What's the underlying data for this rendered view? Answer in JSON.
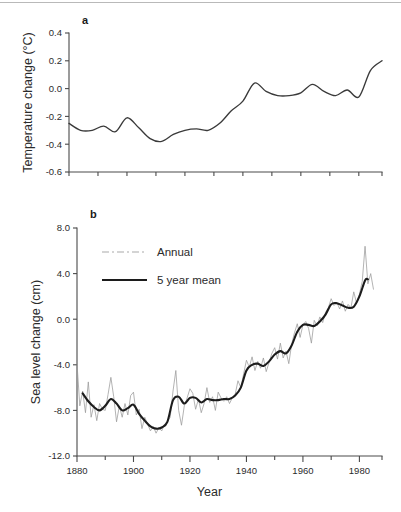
{
  "figure": {
    "panel_a_label": "a",
    "panel_b_label": "b"
  },
  "chart_data": [
    {
      "type": "line",
      "panel": "a",
      "title": "",
      "xlabel": "",
      "ylabel": "Temperature change (°C)",
      "ylim": [
        -0.6,
        0.4
      ],
      "xlim": [
        1880,
        1988
      ],
      "yticks": [
        0.4,
        0.2,
        0.0,
        -0.2,
        -0.4,
        -0.6
      ],
      "ytick_labels": [
        "0.4",
        "0.2",
        "0.0",
        "-0.2",
        "-0.4",
        "-0.6"
      ],
      "xticks": [
        1880,
        1890,
        1900,
        1910,
        1920,
        1930,
        1940,
        1950,
        1960,
        1970,
        1980
      ],
      "xtick_labels": [
        "",
        "",
        "",
        "",
        "",
        "",
        "",
        "",
        "",
        "",
        ""
      ],
      "grid": false,
      "legend": false,
      "series": [
        {
          "name": "Global temperature anomaly (smoothed)",
          "x": [
            1880,
            1884,
            1888,
            1892,
            1896,
            1900,
            1904,
            1908,
            1912,
            1916,
            1920,
            1924,
            1928,
            1932,
            1936,
            1940,
            1944,
            1948,
            1952,
            1956,
            1960,
            1964,
            1968,
            1972,
            1976,
            1980,
            1984,
            1988
          ],
          "values": [
            -0.25,
            -0.3,
            -0.3,
            -0.27,
            -0.31,
            -0.21,
            -0.28,
            -0.36,
            -0.38,
            -0.33,
            -0.3,
            -0.29,
            -0.3,
            -0.25,
            -0.16,
            -0.09,
            0.04,
            -0.02,
            -0.05,
            -0.05,
            -0.03,
            0.03,
            -0.02,
            -0.05,
            -0.01,
            -0.06,
            0.13,
            0.2
          ]
        }
      ]
    },
    {
      "type": "line",
      "panel": "b",
      "title": "",
      "xlabel": "Year",
      "ylabel": "Sea level change (cm)",
      "ylim": [
        -12.0,
        8.0
      ],
      "xlim": [
        1880,
        1988
      ],
      "yticks": [
        8.0,
        4.0,
        0.0,
        -4.0,
        -8.0,
        -12.0
      ],
      "ytick_labels": [
        "8.0",
        "4.0",
        "0.0",
        "-4.0",
        "-8.0",
        "-12.0"
      ],
      "xticks": [
        1880,
        1890,
        1900,
        1910,
        1920,
        1930,
        1940,
        1950,
        1960,
        1970,
        1980
      ],
      "xtick_labels": [
        "1880",
        "",
        "1900",
        "",
        "1920",
        "",
        "1940",
        "",
        "1960",
        "",
        "1980"
      ],
      "grid": false,
      "legend": true,
      "legend_position": "upper-left",
      "legend_entries": [
        "Annual",
        "5 year mean"
      ],
      "series": [
        {
          "name": "Annual",
          "style": "dash-dot-thin",
          "x": [
            1880,
            1881,
            1882,
            1883,
            1884,
            1885,
            1886,
            1887,
            1888,
            1889,
            1890,
            1891,
            1892,
            1893,
            1894,
            1895,
            1896,
            1897,
            1898,
            1899,
            1900,
            1901,
            1902,
            1903,
            1904,
            1905,
            1906,
            1907,
            1908,
            1909,
            1910,
            1911,
            1912,
            1913,
            1914,
            1915,
            1916,
            1917,
            1918,
            1919,
            1920,
            1921,
            1922,
            1923,
            1924,
            1925,
            1926,
            1927,
            1928,
            1929,
            1930,
            1931,
            1932,
            1933,
            1934,
            1935,
            1936,
            1937,
            1938,
            1939,
            1940,
            1941,
            1942,
            1943,
            1944,
            1945,
            1946,
            1947,
            1948,
            1949,
            1950,
            1951,
            1952,
            1953,
            1954,
            1955,
            1956,
            1957,
            1958,
            1959,
            1960,
            1961,
            1962,
            1963,
            1964,
            1965,
            1966,
            1967,
            1968,
            1969,
            1970,
            1971,
            1972,
            1973,
            1974,
            1975,
            1976,
            1977,
            1978,
            1979,
            1980,
            1981,
            1982,
            1983,
            1984,
            1985
          ],
          "values": [
            -3.9,
            -7.6,
            -6.3,
            -8.2,
            -5.5,
            -8.6,
            -7.5,
            -8.9,
            -7.4,
            -7.9,
            -8.0,
            -6.6,
            -5.1,
            -6.8,
            -9.0,
            -7.6,
            -8.6,
            -7.4,
            -8.4,
            -6.7,
            -6.4,
            -8.4,
            -7.9,
            -9.6,
            -8.6,
            -9.2,
            -9.8,
            -9.4,
            -10.0,
            -9.5,
            -9.8,
            -9.2,
            -9.0,
            -8.6,
            -6.3,
            -4.5,
            -8.0,
            -9.3,
            -7.6,
            -6.9,
            -6.1,
            -6.5,
            -7.9,
            -7.0,
            -8.2,
            -7.4,
            -6.0,
            -7.3,
            -6.8,
            -8.0,
            -6.4,
            -6.9,
            -7.2,
            -6.8,
            -7.4,
            -6.9,
            -6.6,
            -5.4,
            -6.0,
            -4.8,
            -3.6,
            -4.2,
            -3.3,
            -4.5,
            -3.7,
            -4.3,
            -3.4,
            -4.6,
            -3.8,
            -3.0,
            -2.5,
            -3.5,
            -2.1,
            -3.4,
            -2.8,
            -3.9,
            -2.2,
            -1.2,
            -0.4,
            -1.6,
            -0.5,
            -0.2,
            -0.8,
            -2.1,
            -0.1,
            -0.6,
            0.2,
            -0.3,
            0.6,
            1.0,
            1.8,
            1.2,
            1.5,
            0.9,
            1.6,
            0.7,
            1.3,
            1.0,
            2.4,
            1.4,
            2.2,
            3.3,
            6.4,
            3.1,
            4.0,
            2.6
          ]
        },
        {
          "name": "5 year mean",
          "style": "solid-thick",
          "x": [
            1882,
            1884,
            1886,
            1888,
            1890,
            1892,
            1894,
            1896,
            1898,
            1900,
            1902,
            1904,
            1906,
            1908,
            1910,
            1912,
            1914,
            1916,
            1918,
            1920,
            1922,
            1924,
            1926,
            1928,
            1930,
            1932,
            1934,
            1936,
            1938,
            1940,
            1942,
            1944,
            1946,
            1948,
            1950,
            1952,
            1954,
            1956,
            1958,
            1960,
            1962,
            1964,
            1966,
            1968,
            1970,
            1972,
            1974,
            1976,
            1978,
            1980,
            1982,
            1983
          ],
          "values": [
            -6.5,
            -7.2,
            -7.7,
            -8.0,
            -7.6,
            -7.0,
            -7.4,
            -8.0,
            -7.8,
            -7.5,
            -8.3,
            -8.9,
            -9.4,
            -9.6,
            -9.5,
            -9.0,
            -7.1,
            -6.8,
            -7.4,
            -6.9,
            -6.9,
            -7.3,
            -7.0,
            -7.1,
            -7.1,
            -7.0,
            -7.0,
            -6.7,
            -6.0,
            -4.5,
            -4.0,
            -3.9,
            -4.1,
            -3.7,
            -3.1,
            -2.8,
            -3.0,
            -2.3,
            -1.1,
            -0.5,
            -0.5,
            -0.6,
            -0.2,
            0.4,
            1.3,
            1.4,
            1.2,
            1.0,
            1.1,
            2.0,
            3.4,
            3.5
          ]
        }
      ]
    }
  ]
}
